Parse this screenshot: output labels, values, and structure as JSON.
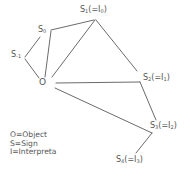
{
  "diagram": {
    "type": "semiosis-chain",
    "line_color": "#666666",
    "text_color": "#555555",
    "nodes": {
      "s_minus1": {
        "base": "S",
        "sub": "-1",
        "suffix": ""
      },
      "s0": {
        "base": "S",
        "sub": "0",
        "suffix": ""
      },
      "s1": {
        "base": "S",
        "sub": "1",
        "paren": "(=I",
        "isub": "0",
        "close": ")"
      },
      "o": {
        "label": "O"
      },
      "s2": {
        "base": "S",
        "sub": "2",
        "paren": "(=I",
        "isub": "1",
        "close": ")"
      },
      "s3": {
        "base": "S",
        "sub": "3",
        "paren": "(=I",
        "isub": "2",
        "close": ")"
      },
      "s4": {
        "base": "S",
        "sub": "4",
        "paren": "(=I",
        "isub": "3",
        "close": ")"
      }
    },
    "edges": [
      [
        "S-1",
        "S0"
      ],
      [
        "S-1",
        "O"
      ],
      [
        "S0",
        "S1"
      ],
      [
        "S0",
        "O"
      ],
      [
        "S1",
        "O"
      ],
      [
        "S1",
        "S2"
      ],
      [
        "O",
        "S2"
      ],
      [
        "S2",
        "S3"
      ],
      [
        "O",
        "S3"
      ],
      [
        "S3",
        "S4"
      ]
    ]
  },
  "legend": {
    "items": [
      "O=Object",
      "S=Sign",
      "I=Interpreta"
    ]
  }
}
